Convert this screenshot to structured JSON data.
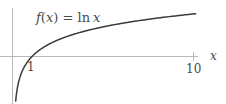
{
  "chart_data": {
    "type": "line",
    "function": "ln x",
    "xlabel": "x",
    "ylabel": "",
    "x_ticks": [
      1,
      10
    ],
    "x_tick_labels": [
      "1",
      "10"
    ],
    "xlim": [
      0,
      11.5
    ],
    "ylim": [
      -2.4,
      2.6
    ],
    "grid": false,
    "legend": "none",
    "series": [
      {
        "name": "f(x) = ln x",
        "x": [
          0.1,
          0.2,
          0.3,
          0.5,
          0.75,
          1,
          1.5,
          2,
          3,
          4,
          5,
          6,
          7,
          8,
          9,
          10
        ],
        "values": [
          -2.303,
          -1.609,
          -1.204,
          -0.693,
          -0.288,
          0,
          0.405,
          0.693,
          1.099,
          1.386,
          1.609,
          1.792,
          1.946,
          2.079,
          2.197,
          2.303
        ]
      }
    ],
    "colors": {
      "curve": "#3a3a3a",
      "axes": "#b8b8b8",
      "text": "#4a4a4a"
    }
  },
  "labels": {
    "title_f": "f",
    "title_paren_open": "(",
    "title_x": "x",
    "title_paren_close": ")",
    "title_eq": " = ",
    "title_ln": "ln",
    "title_arg": "x",
    "tick_1": "1",
    "tick_10": "10",
    "x_axis_label": "x"
  }
}
